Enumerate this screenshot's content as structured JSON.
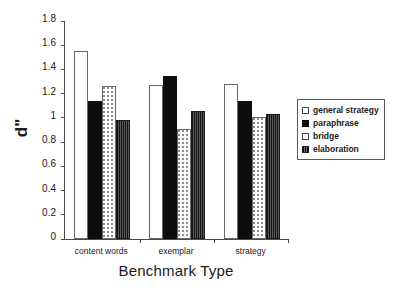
{
  "chart_data": {
    "type": "bar",
    "title": "",
    "subtitle": "",
    "xlabel": "Benchmark Type",
    "ylabel": "d\"",
    "categories": [
      "content words",
      "exemplar",
      "strategy"
    ],
    "series": [
      {
        "name": "general strategy",
        "values": [
          1.55,
          1.27,
          1.28
        ],
        "fill": "open-white",
        "color": "#ffffff"
      },
      {
        "name": "paraphrase",
        "values": [
          1.14,
          1.35,
          1.14
        ],
        "fill": "solid-black",
        "color": "#0d0d0d"
      },
      {
        "name": "bridge",
        "values": [
          1.26,
          0.91,
          1.01
        ],
        "fill": "dotted-light",
        "color": "#fbfbfb"
      },
      {
        "name": "elaboration",
        "values": [
          0.98,
          1.06,
          1.03
        ],
        "fill": "dark-hatch",
        "color": "#3b3b3b"
      }
    ],
    "ylim": [
      0,
      1.8
    ],
    "ytick_step": 0.2,
    "yticks": [
      "0",
      "0.2",
      "0.4",
      "0.6",
      "0.8",
      "1",
      "1.2",
      "1.4",
      "1.6",
      "1.8"
    ],
    "grid": false,
    "legend_position": "right",
    "legend_entries": [
      "general strategy",
      "paraphrase",
      "bridge",
      "elaboration"
    ]
  },
  "axes": {
    "y_title": "d\"",
    "x_title": "Benchmark Type"
  },
  "legend": {
    "items": [
      {
        "label": "general strategy"
      },
      {
        "label": "paraphrase"
      },
      {
        "label": "bridge"
      },
      {
        "label": "elaboration"
      }
    ]
  }
}
